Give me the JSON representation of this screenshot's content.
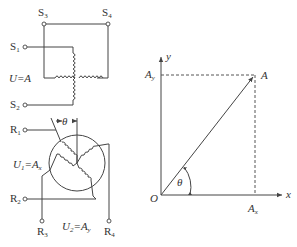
{
  "left_diagram": {
    "stator_terminals": {
      "s1": {
        "main": "S",
        "sub": "1"
      },
      "s2": {
        "main": "S",
        "sub": "2"
      },
      "s3": {
        "main": "S",
        "sub": "3"
      },
      "s4": {
        "main": "S",
        "sub": "4"
      }
    },
    "stator_voltage_label": "U=A",
    "rotor_terminals": {
      "r1": {
        "main": "R",
        "sub": "1"
      },
      "r2": {
        "main": "R",
        "sub": "2"
      },
      "r3": {
        "main": "R",
        "sub": "3"
      },
      "r4": {
        "main": "R",
        "sub": "4"
      }
    },
    "rotor_angle_label": "θ",
    "u1_label": {
      "main": "U",
      "sub": "1",
      "rest": "=A",
      "rest_sub": "x"
    },
    "u2_label": {
      "main": "U",
      "sub": "2",
      "rest": "=A",
      "rest_sub": "y"
    }
  },
  "right_diagram": {
    "origin_label": "O",
    "x_axis_label": "x",
    "y_axis_label": "y",
    "vector_label": "A",
    "ax_label": {
      "main": "A",
      "sub": "x"
    },
    "ay_label": {
      "main": "A",
      "sub": "y"
    },
    "angle_label": "θ"
  }
}
